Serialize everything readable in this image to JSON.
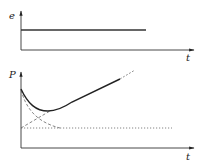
{
  "top_graph": {
    "y_label": "e",
    "x_label": "t",
    "series": [
      {
        "name": "constant-level",
        "style": "solid",
        "description": "constant horizontal line"
      }
    ]
  },
  "bottom_graph": {
    "y_label": "P",
    "x_label": "t",
    "series": [
      {
        "name": "total-curve",
        "style": "solid",
        "description": "decreases to a minimum then rises linearly"
      },
      {
        "name": "decaying-component",
        "style": "dashed",
        "description": "exponential-like decay to baseline"
      },
      {
        "name": "rising-component",
        "style": "dashed",
        "description": "linear increase from baseline"
      },
      {
        "name": "baseline",
        "style": "dotted",
        "description": "constant baseline level"
      }
    ]
  },
  "colors": {
    "line": "#222222",
    "dashed": "#666666",
    "background": "#ffffff"
  }
}
